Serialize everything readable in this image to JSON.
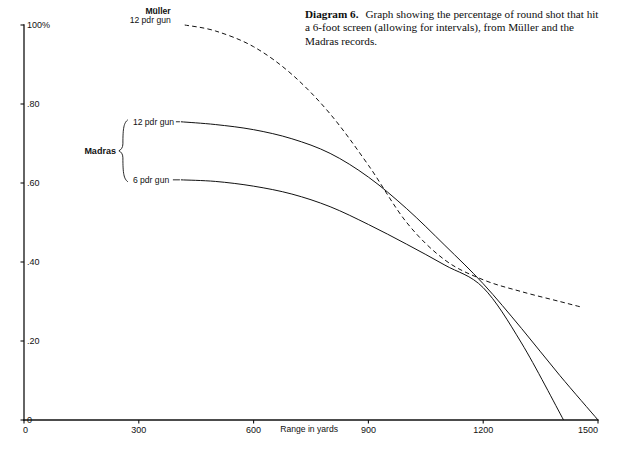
{
  "caption": {
    "figure_number": "Diagram 6.",
    "text": "Graph showing the percentage of round shot that hit a 6-foot screen (allowing for intervals), from Müller and the Madras records."
  },
  "chart_data": {
    "type": "line",
    "title": "Diagram 6.",
    "xlabel": "Range in yards",
    "ylabel": "",
    "xlim": [
      0,
      1500
    ],
    "ylim": [
      0,
      1.0
    ],
    "grid": false,
    "legend": "inline-labels",
    "xticks": [
      0,
      300,
      600,
      900,
      1200,
      1500
    ],
    "xtick_labels": [
      "0",
      "300",
      "600",
      "900",
      "1200",
      "1500"
    ],
    "yticks": [
      0,
      0.2,
      0.4,
      0.6,
      0.8,
      1.0
    ],
    "ytick_labels": [
      "0",
      ".20",
      ".40",
      ".60",
      ".80",
      "100%"
    ],
    "series": [
      {
        "name": "Müller 12 pdr gun",
        "label_line1": "Müller",
        "label_line2": "12 pdr gun",
        "style": "dashed",
        "x": [
          420,
          500,
          600,
          700,
          800,
          900,
          1000,
          1100,
          1200,
          1300,
          1400,
          1460
        ],
        "y": [
          1.0,
          0.985,
          0.945,
          0.875,
          0.775,
          0.645,
          0.5,
          0.405,
          0.355,
          0.325,
          0.3,
          0.285
        ]
      },
      {
        "name": "Madras 12 pdr gun",
        "label": "12 pdr gun",
        "style": "solid",
        "x": [
          410,
          500,
          600,
          700,
          800,
          900,
          1000,
          1100,
          1200,
          1300,
          1400,
          1500
        ],
        "y": [
          0.755,
          0.748,
          0.735,
          0.712,
          0.675,
          0.615,
          0.535,
          0.442,
          0.345,
          0.232,
          0.113,
          0.0
        ]
      },
      {
        "name": "Madras 6 pdr gun",
        "label": "6 pdr gun",
        "style": "solid",
        "x": [
          410,
          500,
          600,
          700,
          800,
          900,
          1000,
          1100,
          1200,
          1300,
          1410
        ],
        "y": [
          0.608,
          0.604,
          0.592,
          0.572,
          0.54,
          0.495,
          0.445,
          0.392,
          0.335,
          0.195,
          0.0
        ]
      }
    ],
    "group_label": "Madras",
    "annotations": []
  },
  "colors": {
    "ink": "#111111",
    "background": "#ffffff"
  }
}
